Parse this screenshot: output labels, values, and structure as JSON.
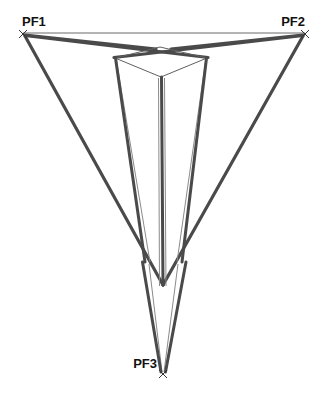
{
  "figure": {
    "type": "perspective-construction-diagram",
    "background_color": "#ffffff",
    "stroke_colors": {
      "thick_guide": "#4a4a4a",
      "thin_guide": "#6f6f6f",
      "horizon": "#5a5a5a",
      "box_edge": "#606060",
      "label_text": "#111111"
    },
    "stroke_widths": {
      "thick_guide": 3.2,
      "thin_guide": 1.1,
      "horizon": 0.9,
      "box_edge": 1.0
    }
  },
  "labels": [
    {
      "id": "pf1",
      "text": "PF1",
      "x": 22,
      "y": 26,
      "anchor": "start"
    },
    {
      "id": "pf2",
      "text": "PF2",
      "x": 305,
      "y": 26,
      "anchor": "end"
    },
    {
      "id": "pf3",
      "text": "PF3",
      "x": 157,
      "y": 368,
      "anchor": "end"
    }
  ],
  "vanishing_points": [
    {
      "id": "pf1",
      "name": "PF1",
      "x": 23,
      "y": 34,
      "marker": "x-cross"
    },
    {
      "id": "pf2",
      "name": "PF2",
      "x": 305,
      "y": 34,
      "marker": "x-cross"
    },
    {
      "id": "pf3",
      "name": "PF3",
      "x": 163,
      "y": 374,
      "marker": "x-cross"
    }
  ],
  "horizon_line": {
    "x1": 23,
    "y1": 33,
    "x2": 305,
    "y2": 33
  },
  "box": {
    "name": "cube-top-face",
    "top_back": {
      "x": 160,
      "y": 47
    },
    "left": {
      "x": 115,
      "y": 58
    },
    "right": {
      "x": 207,
      "y": 58
    },
    "front": {
      "x": 161,
      "y": 77
    },
    "vertical_front": {
      "x1": 161,
      "y1": 77,
      "x2": 163,
      "y2": 284
    },
    "vertical_left": {
      "x1": 115,
      "y1": 58,
      "x2": 144,
      "y2": 262
    },
    "vertical_right": {
      "x1": 207,
      "y1": 58,
      "x2": 183,
      "y2": 262
    }
  },
  "thick_guides": [
    {
      "id": "pf1-to-right-upper",
      "from": "PF1",
      "x1": 24,
      "y1": 35,
      "x2": 156,
      "y2": 49
    },
    {
      "id": "pf2-to-left-upper",
      "from": "PF2",
      "x1": 304,
      "y1": 35,
      "x2": 171,
      "y2": 49
    },
    {
      "id": "pf1-to-box-right-corner",
      "from": "PF1",
      "x1": 24,
      "y1": 35,
      "x2": 208,
      "y2": 57
    },
    {
      "id": "pf2-to-box-left-corner",
      "from": "PF2",
      "x1": 304,
      "y1": 35,
      "x2": 114,
      "y2": 57
    },
    {
      "id": "pf1-long-descend",
      "from": "PF1",
      "x1": 24,
      "y1": 36,
      "x2": 163,
      "y2": 285
    },
    {
      "id": "pf2-long-descend",
      "from": "PF2",
      "x1": 304,
      "y1": 36,
      "x2": 163,
      "y2": 285
    },
    {
      "id": "left-vertical-to-pf3",
      "from": "box-left",
      "x1": 116,
      "y1": 59,
      "x2": 146,
      "y2": 262
    },
    {
      "id": "right-vertical-to-pf3",
      "from": "box-right",
      "x1": 206,
      "y1": 59,
      "x2": 181,
      "y2": 262
    },
    {
      "id": "center-vertical-to-pf3",
      "from": "box-front",
      "x1": 161,
      "y1": 78,
      "x2": 163,
      "y2": 285
    },
    {
      "id": "pf3-ray-left",
      "to": "PF3",
      "x1": 143,
      "y1": 262,
      "x2": 161,
      "y2": 372
    },
    {
      "id": "pf3-ray-right",
      "to": "PF3",
      "x1": 186,
      "y1": 262,
      "x2": 165,
      "y2": 372
    }
  ],
  "thin_guides": [
    {
      "id": "thin-left-inner",
      "x1": 115,
      "y1": 58,
      "x2": 150,
      "y2": 262
    },
    {
      "id": "thin-right-inner",
      "x1": 207,
      "y1": 58,
      "x2": 177,
      "y2": 262
    },
    {
      "id": "thin-center-left",
      "x1": 159,
      "y1": 78,
      "x2": 160,
      "y2": 286
    },
    {
      "id": "thin-center-right",
      "x1": 164,
      "y1": 78,
      "x2": 166,
      "y2": 286
    },
    {
      "id": "thin-pf3-left",
      "x1": 148,
      "y1": 264,
      "x2": 162,
      "y2": 373
    },
    {
      "id": "thin-pf3-right",
      "x1": 178,
      "y1": 264,
      "x2": 164,
      "y2": 373
    }
  ]
}
